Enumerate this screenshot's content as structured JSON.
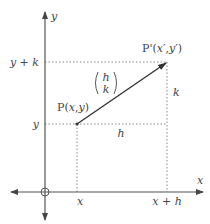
{
  "diagram": {
    "axes": {
      "x_label": "x",
      "y_label": "y"
    },
    "points": {
      "P": {
        "name": "P",
        "coords": "(x,y)",
        "label": "P(x,y)"
      },
      "P_prime": {
        "name": "P'",
        "coords": "(x',y')",
        "label": "P'(x',y')"
      }
    },
    "vector": {
      "top": "h",
      "bottom": "k"
    },
    "tick_labels": {
      "x": "x",
      "x_plus_h": "x + h",
      "y": "y",
      "y_plus_k": "y + k"
    },
    "segment_labels": {
      "horizontal": "h",
      "vertical": "k"
    },
    "colors": {
      "axis": "#555555",
      "vector": "#333333",
      "dotted": "#888888",
      "text": "#444444"
    }
  }
}
